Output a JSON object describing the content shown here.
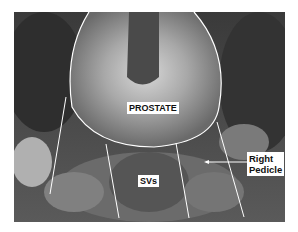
{
  "image": {
    "description": "Grayscale intraoperative photograph with anatomical annotations",
    "labels": {
      "prostate": "PROSTATE",
      "svs": "SVs",
      "pedicle_line1": "Right",
      "pedicle_line2": "Pedicle"
    }
  }
}
